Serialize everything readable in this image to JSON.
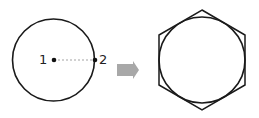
{
  "diagram": {
    "left": {
      "shape": "circle",
      "point_1_label": "1",
      "point_2_label": "2",
      "radius_line": "dashed"
    },
    "arrow": {
      "direction": "right",
      "color": "#a8a8a8"
    },
    "right": {
      "shape": "hexagon circumscribing circle"
    },
    "colors": {
      "stroke": "#1a1a1a",
      "dash": "#999999"
    }
  }
}
